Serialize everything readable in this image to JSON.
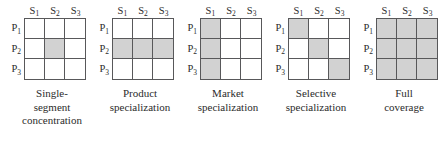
{
  "figure": {
    "row_axis_label": "P",
    "col_axis_label": "S",
    "shaded_color": "#d2d2d2",
    "grid_line_color": "#58585a",
    "text_color": "#2b2b2b",
    "background_color": "#ffffff"
  },
  "axes": {
    "columns": [
      {
        "label": "S",
        "sub": "1"
      },
      {
        "label": "S",
        "sub": "2"
      },
      {
        "label": "S",
        "sub": "3"
      }
    ],
    "rows": [
      {
        "label": "P",
        "sub": "1"
      },
      {
        "label": "P",
        "sub": "2"
      },
      {
        "label": "P",
        "sub": "3"
      }
    ]
  },
  "chart_data": {
    "type": "heatmap",
    "xlabel": "Market segments",
    "ylabel": "Products",
    "categories_x": [
      "S1",
      "S2",
      "S3"
    ],
    "categories_y": [
      "P1",
      "P2",
      "P3"
    ],
    "legend": [
      "shaded = served",
      "unshaded = not served"
    ],
    "grid": true,
    "panels": [
      {
        "id": "single-segment-concentration",
        "caption_lines": [
          "Single-",
          "segment",
          "concentration"
        ],
        "matrix": [
          [
            0,
            0,
            0
          ],
          [
            0,
            1,
            0
          ],
          [
            0,
            0,
            0
          ]
        ],
        "shaded_count": 1
      },
      {
        "id": "product-specialization",
        "caption_lines": [
          "Product",
          "specialization"
        ],
        "matrix": [
          [
            0,
            0,
            0
          ],
          [
            1,
            1,
            1
          ],
          [
            0,
            0,
            0
          ]
        ],
        "shaded_count": 3
      },
      {
        "id": "market-specialization",
        "caption_lines": [
          "Market",
          "specialization"
        ],
        "matrix": [
          [
            1,
            0,
            0
          ],
          [
            1,
            0,
            0
          ],
          [
            1,
            0,
            0
          ]
        ],
        "shaded_count": 3
      },
      {
        "id": "selective-specialization",
        "caption_lines": [
          "Selective",
          "specialization"
        ],
        "matrix": [
          [
            1,
            0,
            0
          ],
          [
            0,
            1,
            0
          ],
          [
            0,
            0,
            1
          ]
        ],
        "shaded_count": 3
      },
      {
        "id": "full-coverage",
        "caption_lines": [
          "Full",
          "coverage"
        ],
        "matrix": [
          [
            1,
            1,
            1
          ],
          [
            1,
            1,
            1
          ],
          [
            1,
            1,
            1
          ]
        ],
        "shaded_count": 9
      }
    ]
  }
}
